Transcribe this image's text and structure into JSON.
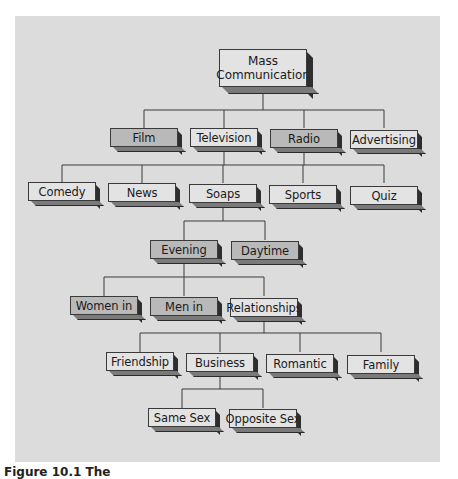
{
  "diagram": {
    "type": "hierarchy-tree",
    "root": "Mass Communication",
    "levels": [
      {
        "parent": "Mass Communication",
        "children": [
          "Film",
          "Television",
          "Radio",
          "Advertising"
        ]
      },
      {
        "parent": [
          "Television",
          "Radio"
        ],
        "children": [
          "Comedy",
          "News",
          "Soaps",
          "Sports",
          "Quiz"
        ]
      },
      {
        "parent": "Soaps",
        "children": [
          "Evening",
          "Daytime"
        ]
      },
      {
        "parent": "Evening",
        "children": [
          "Women in",
          "Men in",
          "Relationships"
        ]
      },
      {
        "parent": "Relationships",
        "children": [
          "Friendship",
          "Business",
          "Romantic",
          "Family"
        ]
      },
      {
        "parent": "Business",
        "children": [
          "Same Sex",
          "Opposite Sex"
        ]
      }
    ]
  },
  "nodes": {
    "root": {
      "line1": "Mass",
      "line2": "Communication"
    },
    "film": "Film",
    "television": "Television",
    "radio": "Radio",
    "advertising": "Advertising",
    "comedy": "Comedy",
    "news": "News",
    "soaps": "Soaps",
    "sports": "Sports",
    "quiz": "Quiz",
    "evening": "Evening",
    "daytime": "Daytime",
    "women_in": "Women in",
    "men_in": "Men in",
    "relationships": "Relationships",
    "friendship": "Friendship",
    "business": "Business",
    "romantic": "Romantic",
    "family": "Family",
    "same_sex": "Same Sex",
    "opposite_sex": "Opposite Sex"
  },
  "caption": "Figure 10.1 The",
  "colors": {
    "panel": "#dcdcdc",
    "node_light": "#e3e3e3",
    "node_dark": "#b9b9b9",
    "line": "#3a3a3a"
  }
}
